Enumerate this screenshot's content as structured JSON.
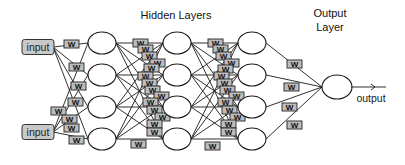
{
  "titles": {
    "hidden_layers": "Hidden Layers",
    "output_layer_line1": "Output",
    "output_layer_line2": "Layer"
  },
  "inputs": [
    {
      "label": "input"
    },
    {
      "label": "input"
    }
  ],
  "weight_label": "W",
  "output_label": "output",
  "network": {
    "input_count": 2,
    "hidden_layers": [
      4,
      4,
      4
    ],
    "output_count": 1,
    "fully_connected": true
  },
  "colors": {
    "background": "#ffffff",
    "stroke": "#1a1a1a",
    "input_fill": "#c9c9c9",
    "weight_fill": "#bdbdbd",
    "node_fill": "#ffffff"
  }
}
